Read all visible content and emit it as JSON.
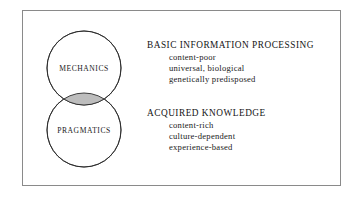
{
  "figure": {
    "title": "",
    "frame": {
      "border_color": "#8a8a8a",
      "background": "#ffffff"
    },
    "venn": {
      "circle_stroke": "#2b2b2b",
      "circle_fill": "#ffffff",
      "overlap_fill": "#bdbdbd",
      "circles": [
        {
          "label": "MECHANICS",
          "position": "top"
        },
        {
          "label": "PRAGMATICS",
          "position": "bottom"
        }
      ]
    },
    "blocks": [
      {
        "heading": "BASIC INFORMATION PROCESSING",
        "items": [
          "content-poor",
          "universal, biological",
          "genetically predisposed"
        ]
      },
      {
        "heading": "ACQUIRED KNOWLEDGE",
        "items": [
          "content-rich",
          "culture-dependent",
          "experience-based"
        ]
      }
    ]
  }
}
